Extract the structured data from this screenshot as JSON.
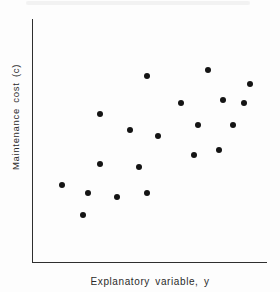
{
  "figure": {
    "colors": {
      "background": "#fdfdfd",
      "axis": "#2f2f2f",
      "dot": "#141414",
      "text": "#2a2a2a"
    }
  },
  "chart_data": {
    "type": "scatter",
    "title": "",
    "xlabel": "Explanatory variable, y",
    "ylabel": "Maintenance cost (c)",
    "legend": false,
    "grid": false,
    "axis_ticks": "none",
    "x_range_percent": [
      0,
      100
    ],
    "y_range_percent": [
      0,
      100
    ],
    "points": [
      {
        "x": 12.4,
        "y": 32.0
      },
      {
        "x": 21.2,
        "y": 19.7
      },
      {
        "x": 23.5,
        "y": 28.5
      },
      {
        "x": 28.8,
        "y": 40.6
      },
      {
        "x": 28.8,
        "y": 60.9
      },
      {
        "x": 36.1,
        "y": 27.0
      },
      {
        "x": 41.5,
        "y": 54.5
      },
      {
        "x": 45.5,
        "y": 39.3
      },
      {
        "x": 48.7,
        "y": 28.7
      },
      {
        "x": 48.9,
        "y": 76.8
      },
      {
        "x": 53.4,
        "y": 52.0
      },
      {
        "x": 63.2,
        "y": 65.4
      },
      {
        "x": 68.8,
        "y": 44.1
      },
      {
        "x": 70.3,
        "y": 56.6
      },
      {
        "x": 74.8,
        "y": 79.1
      },
      {
        "x": 79.3,
        "y": 46.3
      },
      {
        "x": 81.2,
        "y": 66.6
      },
      {
        "x": 85.3,
        "y": 56.6
      },
      {
        "x": 90.2,
        "y": 65.6
      },
      {
        "x": 92.9,
        "y": 73.2
      }
    ]
  }
}
